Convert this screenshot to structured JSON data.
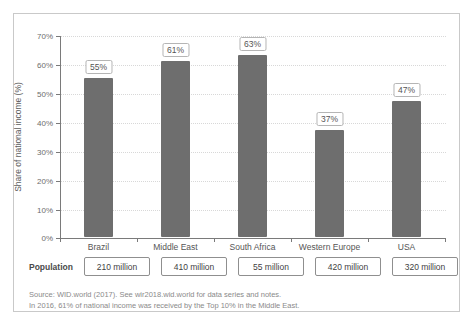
{
  "chart_data": {
    "type": "bar",
    "title": "",
    "subtitle": "",
    "xlabel": "",
    "ylabel": "Share of national income (%)",
    "categories": [
      "Brazil",
      "Middle East",
      "South Africa",
      "Western Europe",
      "USA"
    ],
    "values": [
      55,
      61,
      63,
      37,
      47
    ],
    "value_labels": [
      "55%",
      "61%",
      "63%",
      "37%",
      "47%"
    ],
    "ylim": [
      0,
      70
    ],
    "ytick_values": [
      0,
      10,
      20,
      30,
      40,
      50,
      60,
      70
    ],
    "ytick_labels": [
      "0%",
      "10%",
      "20%",
      "30%",
      "40%",
      "50%",
      "60%",
      "70%"
    ],
    "grid": true,
    "legend": "none",
    "series": [
      {
        "name": "Share of national income (%)",
        "values": [
          55,
          61,
          63,
          37,
          47
        ],
        "color": "#6e6e6e"
      }
    ],
    "annotations": {
      "population_label": "Population",
      "population_values": [
        "210 million",
        "410 million",
        "55 million",
        "420 million",
        "320 million"
      ]
    }
  },
  "axis": {
    "y_title": "Share of national income (%)",
    "y_ticks": [
      "70%",
      "60%",
      "50%",
      "40%",
      "30%",
      "20%",
      "10%",
      "0%"
    ]
  },
  "bars": [
    {
      "category": "Brazil",
      "value_label": "55%",
      "population": "210 million"
    },
    {
      "category": "Middle East",
      "value_label": "61%",
      "population": "410 million"
    },
    {
      "category": "South Africa",
      "value_label": "63%",
      "population": "55 million"
    },
    {
      "category": "Western Europe",
      "value_label": "37%",
      "population": "420 million"
    },
    {
      "category": "USA",
      "value_label": "47%",
      "population": "320 million"
    }
  ],
  "population": {
    "label": "Population"
  },
  "notes": {
    "line1": "Source: WID.world (2017). See wir2018.wid.world for data series and notes.",
    "line2": "In 2016, 61% of national income was received by the Top 10% in the Middle East."
  },
  "colors": {
    "bar": "#6e6e6e",
    "axis": "#7a7a7a",
    "grid": "#d8d8d8",
    "frame": "#c9c9c9",
    "note_text": "#8a8a8a"
  }
}
